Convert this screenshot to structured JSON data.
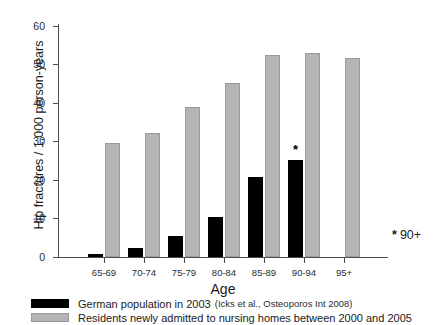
{
  "chart_data": {
    "type": "bar",
    "title": "",
    "xlabel": "Age",
    "ylabel": "Hip fractures / 1,000 person-years",
    "categories": [
      "65-69",
      "70-74",
      "75-79",
      "80-84",
      "85-89",
      "90-94",
      "95+"
    ],
    "ylim": [
      0,
      65
    ],
    "yticks": [
      0,
      10,
      20,
      30,
      40,
      50,
      60
    ],
    "ytick_labels": [
      "0",
      "10",
      "20",
      "30",
      "40",
      "50",
      "60"
    ],
    "grid": false,
    "legend_position": "bottom",
    "series": [
      {
        "name": "German population in 2003",
        "source_note": "(Icks et al., Osteoporos Int 2008)",
        "color": "#000000",
        "values": [
          0.9,
          2.5,
          6.0,
          11.3,
          22.4,
          27.0,
          null
        ]
      },
      {
        "name": "Residents newly admitted to nursing homes between 2000 and 2005",
        "source_note": "",
        "color": "#b4b4b4",
        "values": [
          31.8,
          34.5,
          41.8,
          48.6,
          56.3,
          57.0,
          55.5
        ]
      }
    ],
    "annotations": [
      {
        "text": "*",
        "category": "90-94",
        "series": "German population in 2003",
        "value": 27.0
      }
    ],
    "footnote": {
      "star": "*",
      "text": "90+"
    }
  },
  "axes": {
    "y_title": "Hip fractures / 1,000 person-years",
    "x_title": "Age",
    "y_tick_labels": [
      "60",
      "50",
      "40",
      "30",
      "20",
      "10",
      "0"
    ],
    "x_tick_labels": [
      "65-69",
      "70-74",
      "75-79",
      "80-84",
      "85-89",
      "90-94",
      "95+"
    ]
  },
  "footnote": {
    "star": "*",
    "label": "90+"
  },
  "legend": {
    "items": [
      {
        "swatch": "black",
        "label": "German population in 2003",
        "sub": "(Icks et al., Osteoporos Int 2008)"
      },
      {
        "swatch": "gray",
        "label": "Residents newly admitted to nursing homes between 2000 and 2005",
        "sub": ""
      }
    ]
  },
  "colors": {
    "series_black": "#000000",
    "series_gray": "#b4b4b4",
    "axis": "#4d4d4d",
    "background": "#ffffff"
  }
}
